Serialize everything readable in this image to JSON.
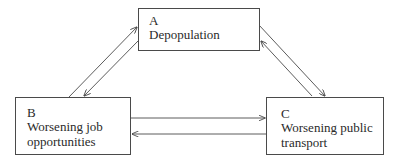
{
  "diagram": {
    "type": "causal-loop",
    "nodes": [
      {
        "id": "A",
        "letter": "A",
        "label": "Depopulation"
      },
      {
        "id": "B",
        "letter": "B",
        "label": "Worsening job\nopportunities"
      },
      {
        "id": "C",
        "letter": "C",
        "label": "Worsening public\ntransport"
      }
    ],
    "edges": [
      {
        "from": "B",
        "to": "A"
      },
      {
        "from": "A",
        "to": "B"
      },
      {
        "from": "A",
        "to": "C"
      },
      {
        "from": "C",
        "to": "A"
      },
      {
        "from": "B",
        "to": "C"
      },
      {
        "from": "C",
        "to": "B"
      }
    ],
    "colors": {
      "line": "#4a4a4a",
      "text": "#2a2a2a",
      "background": "#ffffff"
    }
  }
}
